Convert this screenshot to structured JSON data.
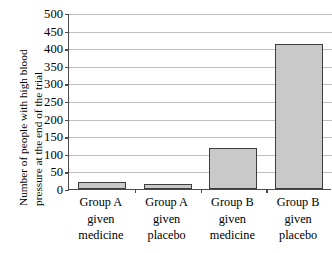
{
  "chart_data": {
    "type": "bar",
    "title": "",
    "xlabel": "",
    "ylabel": "Number of people with high blood pressure at the end of the trial",
    "ylabel_lines": [
      "Number of people with high blood",
      "pressure at the end of the trial"
    ],
    "categories": [
      "Group A given medicine",
      "Group A given placebo",
      "Group B given medicine",
      "Group B given placebo"
    ],
    "category_lines": [
      [
        "Group A",
        "given",
        "medicine"
      ],
      [
        "Group A",
        "given",
        "placebo"
      ],
      [
        "Group B",
        "given",
        "medicine"
      ],
      [
        "Group B",
        "given",
        "placebo"
      ]
    ],
    "values": [
      20,
      15,
      117,
      412
    ],
    "ylim": [
      0,
      500
    ],
    "ytick_step": 50,
    "ytick_labels": [
      "500",
      "450",
      "400",
      "350",
      "300",
      "250",
      "200",
      "150",
      "100",
      "50",
      "0"
    ],
    "ytick_values": [
      500,
      450,
      400,
      350,
      300,
      250,
      200,
      150,
      100,
      50,
      0
    ],
    "grid": true,
    "legend": "none",
    "bar_fill_color": "#c9c9c9",
    "bar_edge_color": "#3d3d3d",
    "axis_color": "#4a4a4a",
    "gridline_color": "#bdbdbd",
    "background_color": "#ffffff"
  }
}
